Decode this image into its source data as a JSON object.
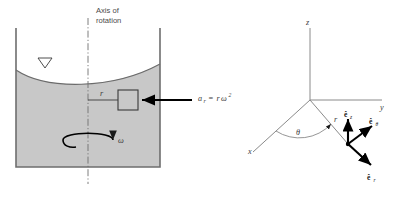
{
  "figure": {
    "background_color": "#ffffff"
  },
  "left_panel": {
    "name": "rotating-container-diagram",
    "axis_label_line1": "Axis of",
    "axis_label_line2": "rotation",
    "fluid_fill_color": "#c8c8c8",
    "wall_color": "#6e6e6e",
    "radius_label": "r",
    "omega_label": "ω",
    "free_surface_marker": "▽",
    "acceleration_expression": {
      "symbol": "a",
      "subscript": "r",
      "equals": "=",
      "rhs_r": "r",
      "rhs_omega": "ω",
      "rhs_exponent": "2",
      "full_text": "a_r = rω²"
    }
  },
  "right_panel": {
    "name": "cylindrical-coordinate-axes",
    "axis_z": "z",
    "axis_y": "y",
    "axis_x": "x",
    "angle_label": "θ",
    "radius_label": "r",
    "unit_vectors": [
      {
        "id": "e-z",
        "base": "ê",
        "subscript": "z",
        "direction": "up"
      },
      {
        "id": "e-theta",
        "base": "ê",
        "subscript": "θ",
        "direction": "upper-right"
      },
      {
        "id": "e-r",
        "base": "ê",
        "subscript": "r",
        "direction": "lower-right"
      }
    ],
    "axis_color": "#8a8a8a",
    "vector_color": "#000000"
  }
}
